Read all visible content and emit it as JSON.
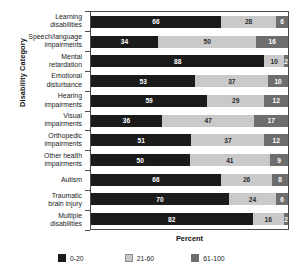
{
  "chart_data": {
    "type": "bar",
    "orientation": "horizontal",
    "stacked": true,
    "stacked_percent": true,
    "title": "",
    "xlabel": "Percent",
    "ylabel": "Disability Category",
    "xlim": [
      0,
      100
    ],
    "grid": false,
    "legend_position": "bottom",
    "categories": [
      "Learning disabilities",
      "Speech/language impairments",
      "Mental retardation",
      "Emotional disturbance",
      "Hearing impairments",
      "Visual impairments",
      "Orthopedic impairments",
      "Other health impairments",
      "Autism",
      "Traumatic brain injury",
      "Multiple disabilities"
    ],
    "category_lines": [
      [
        "Learning",
        "disabilities"
      ],
      [
        "Speech/language",
        "impairments"
      ],
      [
        "Mental",
        "retardation"
      ],
      [
        "Emotional",
        "disturbance"
      ],
      [
        "Hearing",
        "impairments"
      ],
      [
        "Visual",
        "impairments"
      ],
      [
        "Orthopedic",
        "impairments"
      ],
      [
        "Other health",
        "impairments"
      ],
      [
        "Autism"
      ],
      [
        "Traumatic",
        "brain injury"
      ],
      [
        "Multiple",
        "disabilities"
      ]
    ],
    "series": [
      {
        "name": "0-20",
        "color": "#1b1b1b",
        "values": [
          66,
          34,
          88,
          53,
          59,
          36,
          51,
          50,
          66,
          70,
          82
        ]
      },
      {
        "name": "21-60",
        "color": "#c9c9c9",
        "values": [
          28,
          50,
          10,
          37,
          29,
          47,
          37,
          41,
          26,
          24,
          16
        ]
      },
      {
        "name": "61-100",
        "color": "#6e6e6e",
        "values": [
          6,
          16,
          2,
          10,
          12,
          17,
          12,
          9,
          8,
          6,
          2
        ]
      }
    ],
    "rows": [
      {
        "category": "Learning disabilities",
        "segments": [
          66,
          28,
          6
        ]
      },
      {
        "category": "Speech/language impairments",
        "segments": [
          34,
          50,
          16
        ]
      },
      {
        "category": "Mental retardation",
        "segments": [
          88,
          10,
          2
        ]
      },
      {
        "category": "Emotional disturbance",
        "segments": [
          53,
          37,
          10
        ]
      },
      {
        "category": "Hearing impairments",
        "segments": [
          59,
          29,
          12
        ]
      },
      {
        "category": "Visual impairments",
        "segments": [
          36,
          47,
          17
        ]
      },
      {
        "category": "Orthopedic impairments",
        "segments": [
          51,
          37,
          12
        ]
      },
      {
        "category": "Other health impairments",
        "segments": [
          50,
          41,
          9
        ]
      },
      {
        "category": "Autism",
        "segments": [
          66,
          26,
          8
        ]
      },
      {
        "category": "Traumatic brain injury",
        "segments": [
          70,
          24,
          6
        ]
      },
      {
        "category": "Multiple disabilities",
        "segments": [
          82,
          16,
          2
        ]
      }
    ],
    "legend": [
      {
        "label": "0-20",
        "color": "#1b1b1b"
      },
      {
        "label": "21-60",
        "color": "#c9c9c9"
      },
      {
        "label": "61-100",
        "color": "#6e6e6e"
      }
    ]
  }
}
